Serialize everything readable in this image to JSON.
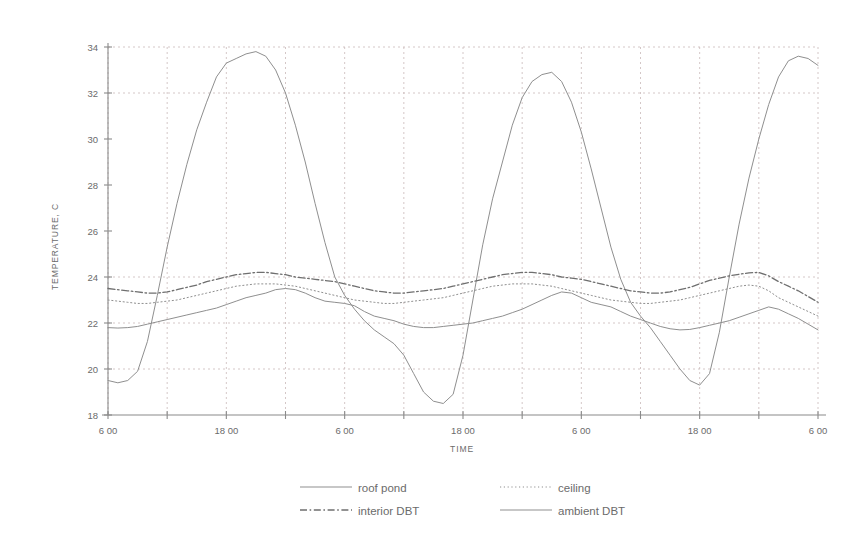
{
  "chart_data": {
    "type": "line",
    "title": "",
    "xlabel": "TIME",
    "ylabel": "TEMPERATURE, C",
    "ylim": [
      18,
      34
    ],
    "y_ticks": [
      18,
      20,
      22,
      24,
      26,
      28,
      30,
      32,
      34
    ],
    "y_tick_labels": [
      "18",
      "20",
      "22",
      "24",
      "26",
      "28",
      "30",
      "32",
      "34"
    ],
    "grid": "dotted horizontal and vertical gridlines",
    "legend_position": "below plot, two columns",
    "x_tick_labels": [
      "6:00",
      "",
      "18:00",
      "",
      "6:00",
      "",
      "18:00",
      "",
      "6:00",
      "",
      "18:00",
      "",
      "6:00"
    ],
    "x_major_labels": [
      "6 00",
      "18 00",
      "6 00",
      "18 00",
      "6 00",
      "18 00",
      "6 00"
    ],
    "x_units": "hours of day over three diurnal cycles",
    "x": [
      0,
      1,
      2,
      3,
      4,
      5,
      6,
      7,
      8,
      9,
      10,
      11,
      12,
      13,
      14,
      15,
      16,
      17,
      18,
      19,
      20,
      21,
      22,
      23,
      24,
      25,
      26,
      27,
      28,
      29,
      30,
      31,
      32,
      33,
      34,
      35,
      36,
      37,
      38,
      39,
      40,
      41,
      42,
      43,
      44,
      45,
      46,
      47,
      48,
      49,
      50,
      51,
      52,
      53,
      54,
      55,
      56,
      57,
      58,
      59,
      60,
      61,
      62,
      63,
      64,
      65,
      66,
      67,
      68,
      69,
      70,
      71,
      72
    ],
    "series": [
      {
        "name": "roof pond",
        "style": "solid",
        "color": "#8f8f8f",
        "values": [
          19.5,
          19.4,
          19.5,
          19.9,
          21.2,
          23.2,
          25.3,
          27.2,
          28.9,
          30.4,
          31.6,
          32.7,
          33.3,
          33.5,
          33.7,
          33.8,
          33.6,
          33.0,
          32.0,
          30.6,
          29.0,
          27.2,
          25.5,
          24.0,
          23.2,
          22.6,
          22.1,
          21.7,
          21.4,
          21.1,
          20.6,
          19.8,
          19.0,
          18.6,
          18.5,
          18.9,
          20.6,
          23.0,
          25.4,
          27.4,
          29.0,
          30.6,
          31.8,
          32.5,
          32.8,
          32.9,
          32.5,
          31.6,
          30.3,
          28.7,
          27.0,
          25.3,
          23.9,
          22.9,
          22.3,
          21.8,
          21.2,
          20.6,
          20.0,
          19.5,
          19.3,
          19.8,
          21.6,
          24.0,
          26.3,
          28.3,
          30.0,
          31.5,
          32.7,
          33.4,
          33.6,
          33.5,
          33.2
        ]
      },
      {
        "name": "ceiling",
        "style": "dotted",
        "color": "#8f8f8f",
        "values": [
          23.0,
          22.95,
          22.9,
          22.85,
          22.85,
          22.9,
          22.95,
          23.0,
          23.1,
          23.2,
          23.3,
          23.4,
          23.5,
          23.6,
          23.65,
          23.7,
          23.7,
          23.7,
          23.65,
          23.6,
          23.5,
          23.4,
          23.3,
          23.2,
          23.1,
          23.0,
          22.95,
          22.9,
          22.85,
          22.85,
          22.9,
          22.95,
          23.0,
          23.05,
          23.1,
          23.2,
          23.3,
          23.4,
          23.5,
          23.6,
          23.65,
          23.7,
          23.7,
          23.7,
          23.65,
          23.6,
          23.5,
          23.4,
          23.3,
          23.2,
          23.1,
          23.0,
          22.95,
          22.9,
          22.85,
          22.85,
          22.9,
          22.95,
          23.0,
          23.1,
          23.2,
          23.3,
          23.4,
          23.5,
          23.6,
          23.65,
          23.6,
          23.4,
          23.1,
          22.9,
          22.7,
          22.5,
          22.3
        ]
      },
      {
        "name": "interior DBT",
        "style": "dashdot",
        "color": "#6f6f6f",
        "values": [
          23.5,
          23.45,
          23.4,
          23.35,
          23.3,
          23.3,
          23.35,
          23.45,
          23.55,
          23.65,
          23.8,
          23.9,
          24.0,
          24.1,
          24.15,
          24.2,
          24.2,
          24.15,
          24.1,
          24.0,
          23.95,
          23.9,
          23.85,
          23.8,
          23.7,
          23.6,
          23.5,
          23.4,
          23.35,
          23.3,
          23.3,
          23.35,
          23.4,
          23.45,
          23.5,
          23.6,
          23.7,
          23.8,
          23.9,
          24.0,
          24.1,
          24.15,
          24.2,
          24.2,
          24.15,
          24.1,
          24.0,
          23.95,
          23.9,
          23.8,
          23.7,
          23.6,
          23.5,
          23.4,
          23.35,
          23.3,
          23.3,
          23.35,
          23.45,
          23.55,
          23.7,
          23.85,
          23.95,
          24.05,
          24.12,
          24.18,
          24.2,
          24.05,
          23.8,
          23.6,
          23.4,
          23.15,
          22.9
        ]
      },
      {
        "name": "ambient DBT",
        "style": "solid",
        "color": "#8f8f8f",
        "values": [
          21.8,
          21.78,
          21.8,
          21.85,
          21.95,
          22.05,
          22.15,
          22.25,
          22.35,
          22.45,
          22.55,
          22.65,
          22.8,
          22.95,
          23.1,
          23.2,
          23.3,
          23.45,
          23.5,
          23.45,
          23.3,
          23.1,
          22.95,
          22.9,
          22.85,
          22.75,
          22.5,
          22.3,
          22.2,
          22.1,
          21.95,
          21.85,
          21.8,
          21.8,
          21.85,
          21.9,
          21.95,
          22.0,
          22.1,
          22.2,
          22.3,
          22.45,
          22.6,
          22.8,
          23.0,
          23.2,
          23.35,
          23.3,
          23.1,
          22.9,
          22.8,
          22.7,
          22.5,
          22.3,
          22.15,
          22.0,
          21.85,
          21.75,
          21.7,
          21.72,
          21.8,
          21.9,
          22.0,
          22.1,
          22.25,
          22.4,
          22.55,
          22.7,
          22.6,
          22.4,
          22.2,
          21.95,
          21.7
        ]
      }
    ],
    "legend": [
      {
        "label": "roof pond",
        "style": "solid"
      },
      {
        "label": "ceiling",
        "style": "dotted"
      },
      {
        "label": "interior DBT",
        "style": "dashdot"
      },
      {
        "label": "ambient DBT",
        "style": "solid"
      }
    ]
  }
}
